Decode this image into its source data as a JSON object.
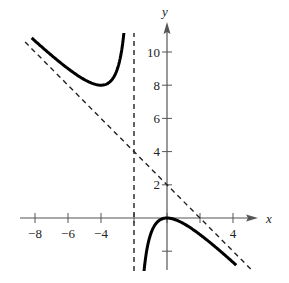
{
  "chart_data": {
    "type": "line",
    "title": "",
    "xlabel": "x",
    "ylabel": "y",
    "xlim": [
      -8.5,
      5.5
    ],
    "ylim": [
      -3.2,
      11.5
    ],
    "x_ticks": [
      -8,
      -6,
      -4,
      -2,
      0,
      2,
      4
    ],
    "x_tick_labels": [
      "−8",
      "−6",
      "−4",
      "",
      "",
      "",
      "4"
    ],
    "y_ticks": [
      -2,
      2,
      4,
      6,
      8,
      10
    ],
    "y_tick_labels": [
      "",
      "2",
      "4",
      "6",
      "8",
      "10"
    ],
    "grid": false,
    "legend": null,
    "function": "f(x) = -x^2/(x+2)",
    "series": [
      {
        "name": "left branch",
        "style": "solid-thick",
        "x": [
          -8.2,
          -7,
          -6,
          -5,
          -4.5,
          -4,
          -3.5,
          -3,
          -2.6,
          -2.4
        ],
        "y": [
          11.1,
          9.8,
          9.0,
          8.33,
          8.1,
          8.0,
          8.17,
          9.0,
          11.3,
          14.4
        ]
      },
      {
        "name": "right branch",
        "style": "solid-thick",
        "x": [
          -1.4,
          -1,
          -0.5,
          0,
          0.5,
          1,
          2,
          3,
          4,
          4.2
        ],
        "y": [
          -3.27,
          -1.0,
          -0.17,
          0,
          -0.1,
          -0.33,
          -1.0,
          -1.8,
          -2.67,
          -2.84
        ]
      },
      {
        "name": "slant asymptote y = -x + 2",
        "style": "dashed",
        "x": [
          -8.6,
          5.4
        ],
        "y": [
          10.6,
          -3.4
        ]
      },
      {
        "name": "vertical asymptote x = -2",
        "style": "dashed",
        "x": [
          -2,
          -2
        ],
        "y": [
          -3.2,
          11.2
        ]
      }
    ],
    "key_points": [
      {
        "label": "local minimum",
        "x": -4,
        "y": 8
      },
      {
        "label": "local maximum",
        "x": 0,
        "y": 0
      }
    ]
  }
}
